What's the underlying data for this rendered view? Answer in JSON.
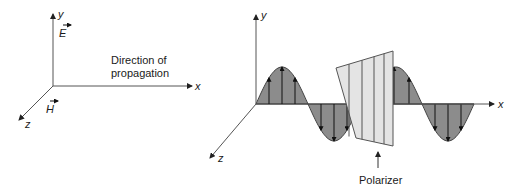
{
  "left_panel": {
    "axis_y": "y",
    "axis_x": "x",
    "axis_z": "z",
    "e_field_label": "E",
    "h_field_label": "H",
    "caption_line1": "Direction of",
    "caption_line2": "propagation"
  },
  "right_panel": {
    "axis_y": "y",
    "axis_x": "x",
    "axis_z": "z",
    "polarizer_label": "Polarizer"
  },
  "colors": {
    "wave_fill": "#8c8c8c",
    "polarizer_fill": "#e4e4e4",
    "line": "#333333"
  }
}
